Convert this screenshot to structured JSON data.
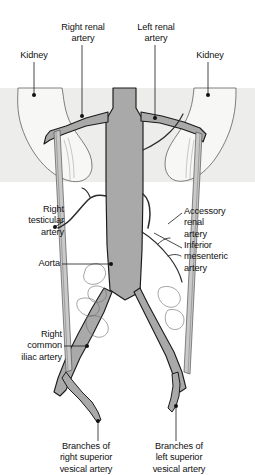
{
  "figure": {
    "background_band_color": "#ededeb",
    "vessel_fill_color": "#a9a9a9",
    "vessel_stroke_color": "#1a1a1a",
    "leader_color": "#1a1a1a",
    "page_background": "#ffffff"
  },
  "labels": {
    "kidney_right": "Kidney",
    "right_renal_artery": "Right renal\nartery",
    "left_renal_artery": "Left renal\nartery",
    "kidney_left": "Kidney",
    "right_testicular_artery": "Right\ntesticular\nartery",
    "aorta": "Aorta",
    "accessory_renal_artery": "Accessory\nrenal\nartery",
    "inferior_mesenteric_artery": "Inferior\nmesenteric\nartery",
    "right_common_iliac_artery": "Right\ncommon\niliac artery",
    "branches_right_superior_vesical_artery": "Branches of\nright superior\nvesical artery",
    "branches_left_superior_vesical_artery": "Branches of\nleft superior\nvesical artery"
  }
}
